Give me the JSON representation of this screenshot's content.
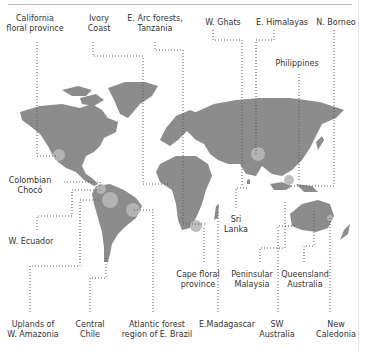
{
  "colors": {
    "land": "#8c8c8c",
    "hotspot": "#b8b8b8",
    "leader": "#555555",
    "text": "#333333"
  },
  "labels": {
    "top": [
      {
        "id": "california",
        "text": "California\nfloral province",
        "x": 35,
        "y": 14
      },
      {
        "id": "ivory_coast",
        "text": "Ivory\nCoast",
        "x": 99,
        "y": 14
      },
      {
        "id": "e_arc",
        "text": "E. Arc forests,\nTanzania",
        "x": 155,
        "y": 14
      },
      {
        "id": "w_ghats",
        "text": "W. Ghats",
        "x": 223,
        "y": 18
      },
      {
        "id": "e_himalayas",
        "text": "E. Himalayas",
        "x": 282,
        "y": 18
      },
      {
        "id": "n_borneo",
        "text": "N. Borneo",
        "x": 336,
        "y": 18
      },
      {
        "id": "philippines",
        "text": "Philippines",
        "x": 297,
        "y": 59
      }
    ],
    "middle": [
      {
        "id": "colombian_choco",
        "text": "Colombian\nChocó",
        "x": 30,
        "y": 176
      },
      {
        "id": "w_ecuador",
        "text": "W. Ecuador",
        "x": 31,
        "y": 237
      },
      {
        "id": "sri_lanka",
        "text": "Sri\nLanka",
        "x": 236,
        "y": 215
      },
      {
        "id": "cape_floral",
        "text": "Cape floral\nprovince",
        "x": 198,
        "y": 270
      },
      {
        "id": "peninsular_malaysia",
        "text": "Peninsular\nMalaysia",
        "x": 252,
        "y": 270
      },
      {
        "id": "queensland",
        "text": "Queensland\nAustralia",
        "x": 305,
        "y": 270
      }
    ],
    "bottom": [
      {
        "id": "w_amazonia",
        "text": "Uplands of\nW. Amazonia",
        "x": 33,
        "y": 320
      },
      {
        "id": "central_chile",
        "text": "Central\nChile",
        "x": 90,
        "y": 320
      },
      {
        "id": "atlantic_forest",
        "text": "Atlantic forest\nregion of E. Brazil",
        "x": 157,
        "y": 320
      },
      {
        "id": "e_madagascar",
        "text": "E.Madagascar",
        "x": 227,
        "y": 320
      },
      {
        "id": "sw_australia",
        "text": "SW\nAustralia",
        "x": 277,
        "y": 320
      },
      {
        "id": "new_caledonia",
        "text": "New\nCaledonia",
        "x": 336,
        "y": 320
      }
    ]
  }
}
